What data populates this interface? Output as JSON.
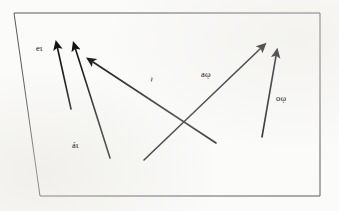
{
  "figure": {
    "background_color": "#fbfbf9",
    "ink_color": "#141414",
    "frame_color": "#5a5a5a",
    "frame": {
      "name": "quadrilateral-border",
      "points": "14,13 320,13 320,196 40,196"
    },
    "arrows": [
      {
        "id": "arrow-1",
        "label": "eι",
        "tail_x": 71,
        "tail_y": 109,
        "head_x": 56,
        "head_y": 45,
        "direction": "up-left"
      },
      {
        "id": "arrow-2",
        "label": "áι",
        "tail_x": 110,
        "tail_y": 158,
        "head_x": 74,
        "head_y": 46,
        "direction": "up-left"
      },
      {
        "id": "arrow-3",
        "label": "ι",
        "tail_x": 216,
        "tail_y": 143,
        "head_x": 90,
        "head_y": 60,
        "direction": "up-left"
      },
      {
        "id": "arrow-4",
        "label": "aῳ",
        "tail_x": 144,
        "tail_y": 160,
        "head_x": 263,
        "head_y": 46,
        "direction": "up-right"
      },
      {
        "id": "arrow-5",
        "label": "oῳ",
        "tail_x": 262,
        "tail_y": 137,
        "head_x": 277,
        "head_y": 53,
        "direction": "up-right"
      }
    ],
    "labels": {
      "e_label": "eι",
      "a1_label": "áι",
      "mid_label": "ι",
      "a2_label": "aῳ",
      "o_label": "oῳ"
    }
  }
}
